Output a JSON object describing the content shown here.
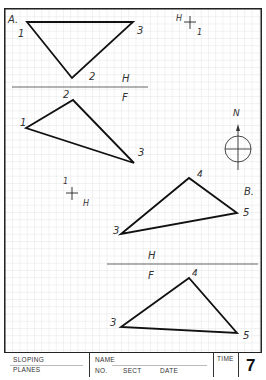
{
  "sheet": {
    "grid_color": "#d0d0d0",
    "line_color": "#111111"
  },
  "problem_a": {
    "label": "A.",
    "top_view": {
      "points": {
        "1": "1",
        "2": "2",
        "3": "3"
      },
      "vertices": [
        [
          27,
          22
        ],
        [
          72,
          78
        ],
        [
          133,
          22
        ]
      ]
    },
    "front_view": {
      "points": {
        "1": "1",
        "2": "2",
        "3": "3"
      },
      "vertices": [
        [
          26,
          128
        ],
        [
          73,
          100
        ],
        [
          134,
          163
        ]
      ]
    },
    "fold_line": {
      "top_label": "H",
      "bottom_label": "F"
    },
    "bearing_marker": {
      "h_label": "H",
      "point_label": "1"
    }
  },
  "north_arrow": {
    "label": "N"
  },
  "problem_b": {
    "label": "B.",
    "top_view": {
      "points": {
        "3": "3",
        "4": "4",
        "5": "5"
      },
      "vertices": [
        [
          121,
          234
        ],
        [
          189,
          178
        ],
        [
          237,
          213
        ]
      ]
    },
    "front_view": {
      "points": {
        "3": "3",
        "4": "4",
        "5": "5"
      },
      "vertices": [
        [
          121,
          327
        ],
        [
          189,
          278
        ],
        [
          237,
          333
        ]
      ]
    },
    "fold_line": {
      "top_label": "H",
      "bottom_label": "F"
    },
    "bearing_marker": {
      "point_label": "1",
      "h_label": "H"
    }
  },
  "title_block": {
    "title_line1": "SLOPING",
    "title_line2": "PLANES",
    "name_label": "NAME",
    "no_label": "NO.",
    "sect_label": "SECT",
    "date_label": "DATE",
    "time_label": "TIME",
    "sheet_number": "7"
  }
}
